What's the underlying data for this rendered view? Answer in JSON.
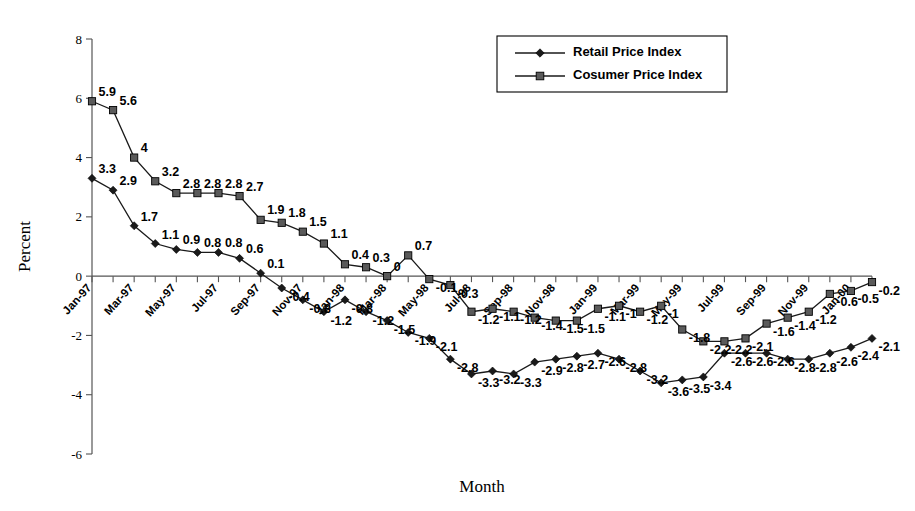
{
  "chart_data": {
    "type": "line",
    "title": "",
    "xlabel": "Month",
    "ylabel": "Percent",
    "ylim": [
      -6,
      8
    ],
    "yticks": [
      8,
      6,
      4,
      2,
      0,
      -2,
      -4,
      -6
    ],
    "grid": false,
    "legend_position": "top-right",
    "x": [
      "Jan-97",
      "Feb-97",
      "Mar-97",
      "Apr-97",
      "May-97",
      "Jun-97",
      "Jul-97",
      "Aug-97",
      "Sep-97",
      "Oct-97",
      "Nov-97",
      "Dec-97",
      "Jan-98",
      "Feb-98",
      "Mar-98",
      "Apr-98",
      "May-98",
      "Jun-98",
      "Jul-98",
      "Aug-98",
      "Sep-98",
      "Oct-98",
      "Nov-98",
      "Dec-98",
      "Jan-99",
      "Feb-99",
      "Mar-99",
      "Apr-99",
      "May-99",
      "Jun-99",
      "Jul-99",
      "Aug-99",
      "Sep-99",
      "Oct-99",
      "Nov-99",
      "Dec-99",
      "Jan-00",
      "Feb-00"
    ],
    "xtick_labels": [
      "Jan-97",
      "Mar-97",
      "May-97",
      "Jul-97",
      "Sep-97",
      "Nov-97",
      "Jan-98",
      "Mar-98",
      "May-98",
      "Jul-98",
      "Sep-98",
      "Nov-98",
      "Jan-99",
      "Mar-99",
      "May-99",
      "Jul-99",
      "Sep-99",
      "Nov-99",
      "Jan-00"
    ],
    "series": [
      {
        "name": "Retail Price Index",
        "marker": "diamond",
        "values": [
          3.3,
          2.9,
          1.7,
          1.1,
          0.9,
          0.8,
          0.8,
          0.6,
          0.1,
          -0.4,
          -0.8,
          -1.2,
          -0.8,
          -1.2,
          -1.5,
          -1.9,
          -2.1,
          -2.8,
          -3.3,
          -3.2,
          -3.3,
          -2.9,
          -2.8,
          -2.7,
          -2.6,
          -2.8,
          -3.2,
          -3.6,
          -3.5,
          -3.4,
          -2.6,
          -2.6,
          -2.6,
          -2.8,
          -2.8,
          -2.6,
          -2.4,
          -2.1
        ],
        "labels": [
          "3.3",
          "2.9",
          "1.7",
          "1.1",
          "0.9",
          "0.8",
          "0.8",
          "0.6",
          "0.1",
          "-0.4",
          "-0.8",
          "-1.2",
          "-0.8",
          "-1.2",
          "-1.5",
          "-1.9",
          "-2.1",
          "-2.8",
          "-3.3",
          "-3.2",
          "-3.3",
          "-2.9",
          "-2.8",
          "-2.7",
          "-2.6",
          "-2.8",
          "-3.2",
          "-3.6",
          "-3.5",
          "-3.4",
          "-2.6",
          "-2.6",
          "-2.6",
          "-2.8",
          "-2.8",
          "-2.6",
          "-2.4",
          "-2.1"
        ]
      },
      {
        "name": "Cosumer Price Index",
        "marker": "square",
        "values": [
          5.9,
          5.6,
          4.0,
          3.2,
          2.8,
          2.8,
          2.8,
          2.7,
          1.9,
          1.8,
          1.5,
          1.1,
          0.4,
          0.3,
          0.0,
          0.7,
          -0.1,
          -0.3,
          -1.2,
          -1.1,
          -1.2,
          -1.4,
          -1.5,
          -1.5,
          -1.1,
          -1.0,
          -1.2,
          -1.0,
          -1.8,
          -2.2,
          -2.2,
          -2.1,
          -1.6,
          -1.4,
          -1.2,
          -0.6,
          -0.5,
          -0.2
        ],
        "labels": [
          "5.9",
          "5.6",
          "4",
          "3.2",
          "2.8",
          "2.8",
          "2.8",
          "2.7",
          "1.9",
          "1.8",
          "1.5",
          "1.1",
          "0.4",
          "0.3",
          "0",
          "0.7",
          "-0.1",
          "-0.3",
          "-1.2",
          "-1.1",
          "-1.2",
          "-1.4",
          "-1.5",
          "-1.5",
          "-1.1",
          "-1",
          "-1.2",
          "-1",
          "-1.8",
          "-2.2",
          "-2.2",
          "-2.1",
          "-1.6",
          "-1.4",
          "-1.2",
          "-0.6",
          "-0.5",
          "-0.2"
        ]
      }
    ]
  },
  "legend": {
    "entries": [
      {
        "label": "Retail Price Index",
        "marker": "diamond"
      },
      {
        "label": "Cosumer Price Index",
        "marker": "square"
      }
    ]
  }
}
